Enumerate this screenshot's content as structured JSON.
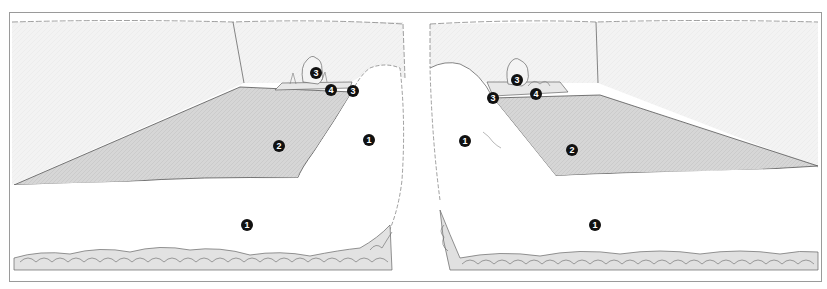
{
  "figure": {
    "panels": [
      {
        "name": "left-view",
        "markers": [
          {
            "label": "3",
            "x": 316,
            "y": 73
          },
          {
            "label": "4",
            "x": 331,
            "y": 90
          },
          {
            "label": "3",
            "x": 353,
            "y": 91
          },
          {
            "label": "2",
            "x": 279,
            "y": 146
          },
          {
            "label": "1",
            "x": 369,
            "y": 140
          },
          {
            "label": "1",
            "x": 247,
            "y": 225
          }
        ]
      },
      {
        "name": "right-view",
        "markers": [
          {
            "label": "3",
            "x": 517,
            "y": 80
          },
          {
            "label": "4",
            "x": 536,
            "y": 94
          },
          {
            "label": "3",
            "x": 493,
            "y": 98
          },
          {
            "label": "2",
            "x": 572,
            "y": 150
          },
          {
            "label": "1",
            "x": 465,
            "y": 141
          },
          {
            "label": "1",
            "x": 595,
            "y": 225
          }
        ]
      }
    ],
    "colors": {
      "frame": "#9a9a9a",
      "line": "#555555",
      "lawn": "#d4d4d4",
      "wall": "#f1f1f1",
      "marker": "#111111"
    }
  }
}
